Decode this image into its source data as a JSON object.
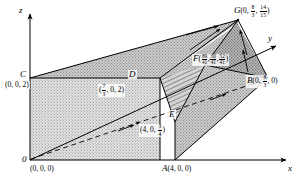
{
  "figure": {
    "kind": "3d-coordinate-diagram",
    "axes": {
      "x_label": "x",
      "y_label": "y",
      "z_label": "z"
    },
    "origin": {
      "name": "0",
      "coords": "(0, 0, 0)"
    },
    "points": [
      {
        "id": "A",
        "name": "A",
        "coords_plain": "(4, 0, 0)",
        "x": "4",
        "y": "0",
        "z": "0"
      },
      {
        "id": "B",
        "name": "B",
        "x": "0",
        "y_num": "8",
        "y_den": "3",
        "z": "0"
      },
      {
        "id": "C",
        "name": "C",
        "coords_plain": "(0, 0, 2)",
        "x": "0",
        "y": "0",
        "z": "2"
      },
      {
        "id": "D",
        "name": "D",
        "x_num": "7",
        "x_den": "3",
        "y": "0",
        "z": "2"
      },
      {
        "id": "E",
        "name": "E",
        "x": "4",
        "y": "0",
        "z_num": "3",
        "z_den": "4"
      },
      {
        "id": "F",
        "name": "F",
        "x_num": "89",
        "x_den": "41",
        "y_num": "50",
        "y_den": "41",
        "z_num": "52",
        "z_den": "41"
      },
      {
        "id": "G",
        "name": "G",
        "x": "0",
        "y_num": "8",
        "y_den": "3",
        "z_num": "14",
        "z_den": "15"
      }
    ],
    "punct": {
      "open": "(",
      "close": ")",
      "comma": ",",
      "comma_sp": ", "
    },
    "colors": {
      "line": "#000000",
      "fill_light": "#d9d9d9",
      "fill_mid": "#c0c0c0",
      "fill_dark": "#a8a8a8",
      "background": "#ffffff"
    }
  }
}
